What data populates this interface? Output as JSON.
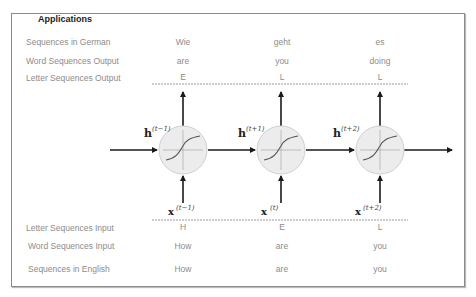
{
  "title": "Applications",
  "rows_top": [
    {
      "label": "Sequences in German",
      "values": [
        "Wie",
        "geht",
        "es"
      ]
    },
    {
      "label": "Word Sequences Output",
      "values": [
        "are",
        "you",
        "doing"
      ]
    },
    {
      "label": "Letter Sequences Output",
      "values": [
        "E",
        "L",
        "L"
      ]
    }
  ],
  "rows_bottom": [
    {
      "label": "Letter Sequences Input",
      "values": [
        "H",
        "E",
        "L"
      ]
    },
    {
      "label": "Word Sequences Input",
      "values": [
        "How",
        "are",
        "you"
      ]
    },
    {
      "label": "Sequences in English",
      "values": [
        "How",
        "are",
        "you"
      ]
    }
  ],
  "hidden_states": [
    {
      "base": "h",
      "sup": "(t−1)"
    },
    {
      "base": "h",
      "sup": "(t+1)"
    },
    {
      "base": "h",
      "sup": "(t+2)"
    }
  ],
  "inputs": [
    {
      "base": "x",
      "sup": "(t−1)"
    },
    {
      "base": "x",
      "sup": "(t)"
    },
    {
      "base": "x",
      "sup": "(t+2)"
    }
  ],
  "colors": {
    "node_fill": "#ececec",
    "node_stroke": "#d0d0d0",
    "arrow": "#1a1a1a",
    "label_text": "#8c8c8c",
    "dotted_line": "#9a9a9a"
  }
}
